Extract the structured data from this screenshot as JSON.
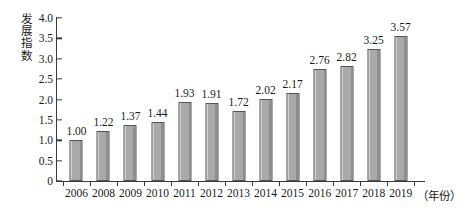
{
  "chart_data": {
    "type": "bar",
    "title": "",
    "subtitle": "",
    "xlabel": "（年份）",
    "ylabel": "发展指数",
    "categories": [
      "2006",
      "2008",
      "2009",
      "2010",
      "2011",
      "2012",
      "2013",
      "2014",
      "2015",
      "2016",
      "2017",
      "2018",
      "2019"
    ],
    "values": [
      1.0,
      1.22,
      1.37,
      1.44,
      1.93,
      1.91,
      1.72,
      2.02,
      2.17,
      2.76,
      2.82,
      3.25,
      3.57
    ],
    "value_labels": [
      "1.00",
      "1.22",
      "1.37",
      "1.44",
      "1.93",
      "1.91",
      "1.72",
      "2.02",
      "2.17",
      "2.76",
      "2.82",
      "3.25",
      "3.57"
    ],
    "series": [
      {
        "name": "发展指数",
        "values": [
          1.0,
          1.22,
          1.37,
          1.44,
          1.93,
          1.91,
          1.72,
          2.02,
          2.17,
          2.76,
          2.82,
          3.25,
          3.57
        ]
      }
    ],
    "ylim": [
      0,
      4.0
    ],
    "yticks": [
      0,
      0.5,
      1.0,
      1.5,
      2.0,
      2.5,
      3.0,
      3.5,
      4.0
    ],
    "ytick_labels": [
      "0",
      "0.5",
      "1.0",
      "1.5",
      "2.0",
      "2.5",
      "3.0",
      "3.5",
      "4.0"
    ],
    "grid": false,
    "legend": null,
    "legend_position": "none",
    "bar_color": "#a9a9a9",
    "bar_edge_color": "#555555",
    "axis_color": "#3a3a3a",
    "background_color": "#ffffff",
    "annotations": []
  },
  "axis": {
    "y_title_text": "发展指数",
    "x_unit_text": "（年份）"
  }
}
